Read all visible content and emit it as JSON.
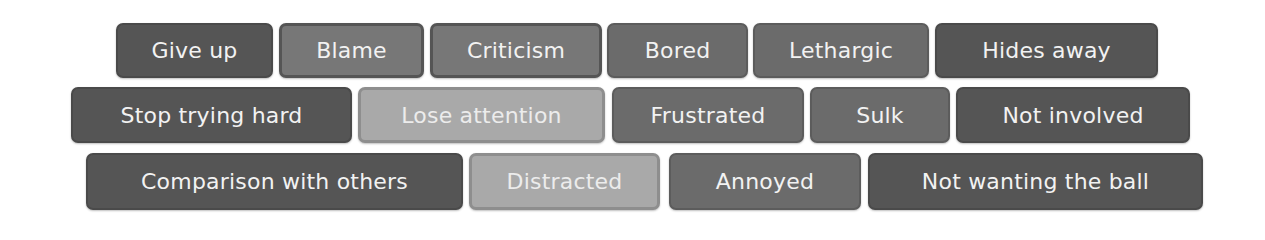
{
  "rows": [
    {
      "tags": [
        {
          "label": "Give up",
          "shade": "dark",
          "x": 116,
          "y": 23,
          "w": 157,
          "h": 55
        },
        {
          "label": "Blame",
          "shade": "mid2",
          "x": 279,
          "y": 23,
          "w": 145,
          "h": 55
        },
        {
          "label": "Criticism",
          "shade": "mid2",
          "x": 430,
          "y": 23,
          "w": 172,
          "h": 55
        },
        {
          "label": "Bored",
          "shade": "mid",
          "x": 607,
          "y": 23,
          "w": 141,
          "h": 55
        },
        {
          "label": "Lethargic",
          "shade": "mid",
          "x": 753,
          "y": 23,
          "w": 176,
          "h": 55
        },
        {
          "label": "Hides away",
          "shade": "dark",
          "x": 935,
          "y": 23,
          "w": 223,
          "h": 55
        }
      ]
    },
    {
      "tags": [
        {
          "label": "Stop trying hard",
          "shade": "dark",
          "x": 71,
          "y": 87,
          "w": 281,
          "h": 56
        },
        {
          "label": "Lose attention",
          "shade": "light",
          "x": 358,
          "y": 87,
          "w": 247,
          "h": 56
        },
        {
          "label": "Frustrated",
          "shade": "mid",
          "x": 612,
          "y": 87,
          "w": 192,
          "h": 56
        },
        {
          "label": "Sulk",
          "shade": "mid",
          "x": 810,
          "y": 87,
          "w": 140,
          "h": 56
        },
        {
          "label": "Not involved",
          "shade": "dark",
          "x": 956,
          "y": 87,
          "w": 234,
          "h": 56
        }
      ]
    },
    {
      "tags": [
        {
          "label": "Comparison with others",
          "shade": "dark",
          "x": 86,
          "y": 153,
          "w": 377,
          "h": 57
        },
        {
          "label": "Distracted",
          "shade": "light",
          "x": 469,
          "y": 153,
          "w": 191,
          "h": 57
        },
        {
          "label": "Annoyed",
          "shade": "mid",
          "x": 669,
          "y": 153,
          "w": 192,
          "h": 57
        },
        {
          "label": "Not wanting the ball",
          "shade": "dark",
          "x": 868,
          "y": 153,
          "w": 335,
          "h": 57
        }
      ]
    }
  ],
  "colors": {
    "dark": "#555555",
    "mid": "#6b6b6b",
    "mid2": "#777777",
    "light": "#a9a9a9",
    "text": "#f2f2f2",
    "background": "#ffffff"
  }
}
